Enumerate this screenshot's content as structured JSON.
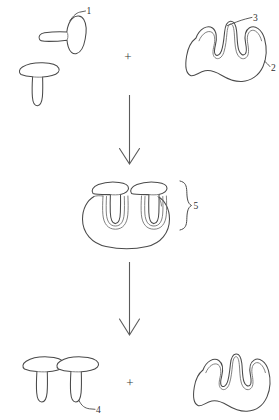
{
  "figure": {
    "line_color": "#4a4a4a",
    "background_color": "#ffffff",
    "width": 279,
    "height": 420
  },
  "operators": {
    "plus_top": "+",
    "plus_bottom": "+"
  },
  "reference_labels": {
    "label_1": "1",
    "label_2": "2",
    "label_3": "3",
    "label_4": "4",
    "label_5": "5"
  },
  "rows": {
    "reactants": {
      "left_group_name": "ligand-monomers",
      "right_group_name": "receptor-blob",
      "ligand_tilted_label": "1",
      "receptor_edge_label": "2",
      "receptor_pocket_label": "3"
    },
    "intermediate": {
      "complex_name": "bound-complex",
      "brace_label": "5"
    },
    "products": {
      "dimer_name": "ligand-dimer",
      "dimer_label": "4",
      "receptor_name": "free-receptor"
    }
  },
  "arrows": {
    "first": "downward-arrow",
    "second": "downward-arrow"
  }
}
